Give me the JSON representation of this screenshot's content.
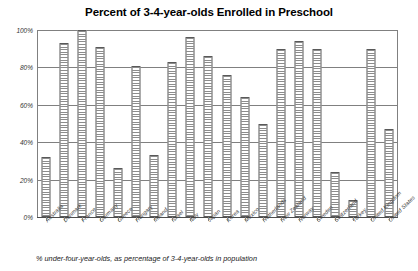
{
  "chart_data": {
    "type": "bar",
    "title": "Percent of 3-4-year-olds Enrolled in Preschool",
    "xlabel": "",
    "ylabel": "",
    "ylim": [
      0,
      100
    ],
    "ytick_labels": [
      "100%",
      "80%",
      "60%",
      "40%",
      "20%",
      "0%"
    ],
    "ytick_values": [
      100,
      80,
      60,
      40,
      20,
      0
    ],
    "grid": true,
    "legend": "none",
    "footnote": "% under-four-year-olds, as percentage of 3-4-year-olds in population",
    "categories": [
      "Australia",
      "Denmark",
      "France",
      "Germany",
      "Greece",
      "Hungary",
      "Ireland",
      "Israel",
      "Italy",
      "Japan",
      "Korea",
      "Mexico",
      "Netherlands",
      "New Zealand",
      "Norway",
      "Sweden",
      "Switzerland",
      "Turkey",
      "United Kingdom",
      "United States"
    ],
    "values": [
      32,
      93,
      100,
      91,
      26,
      81,
      33,
      83,
      96,
      86,
      76,
      64,
      50,
      90,
      94,
      90,
      24,
      9,
      90,
      47
    ]
  },
  "style": {
    "bar_outline": "#595959",
    "bar_hatch": "#8c8c8c",
    "grid_color": "#808080",
    "text_color": "#000000"
  }
}
